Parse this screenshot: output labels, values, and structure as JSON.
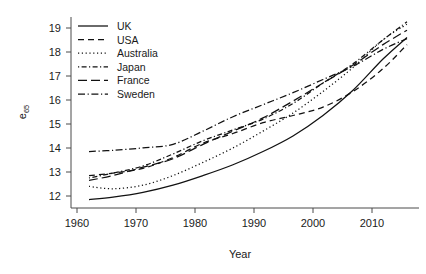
{
  "chart_data": {
    "type": "line",
    "title": "",
    "xlabel": "Year",
    "ylabel": "e65",
    "ylabel_base": "e",
    "ylabel_sub": "65",
    "xlim": [
      1958,
      2016
    ],
    "ylim": [
      11.5,
      19.45
    ],
    "xticks": [
      1960,
      1970,
      1980,
      1990,
      2000,
      2010
    ],
    "yticks": [
      12,
      13,
      14,
      15,
      16,
      17,
      18,
      19
    ],
    "xtick_labels": [
      "1960",
      "1970",
      "1980",
      "1990",
      "2000",
      "2010"
    ],
    "ytick_labels": [
      "12",
      "13",
      "14",
      "15",
      "16",
      "17",
      "18",
      "19"
    ],
    "grid": false,
    "legend_position": "top-left",
    "legend_entries": [
      "UK",
      "USA",
      "Australia",
      "Japan",
      "France",
      "Sweden"
    ],
    "x": [
      1961,
      1965,
      1970,
      1975,
      1980,
      1985,
      1990,
      1995,
      2000,
      2005,
      2010,
      2014
    ],
    "series": [
      {
        "name": "UK",
        "style": "solid",
        "dash": "none",
        "color": "#111111",
        "values": [
          11.85,
          11.95,
          12.15,
          12.45,
          12.85,
          13.3,
          13.85,
          14.5,
          15.35,
          16.4,
          17.7,
          18.6
        ]
      },
      {
        "name": "USA",
        "style": "dashed",
        "dash": "6,4",
        "color": "#111111",
        "values": [
          12.85,
          12.95,
          13.15,
          13.6,
          14.2,
          14.6,
          15.05,
          15.35,
          15.7,
          16.35,
          17.3,
          18.3
        ]
      },
      {
        "name": "Australia",
        "style": "dotted",
        "dash": "1.2,2.6",
        "color": "#111111",
        "values": [
          12.4,
          12.3,
          12.45,
          12.85,
          13.4,
          14.0,
          14.7,
          15.45,
          16.35,
          17.35,
          18.5,
          19.15
        ]
      },
      {
        "name": "Japan",
        "style": "dashdot-short",
        "dash": "1.2,2.4,5,2.4",
        "color": "#111111",
        "values": [
          12.75,
          12.95,
          13.25,
          13.75,
          14.3,
          14.75,
          15.2,
          15.85,
          16.7,
          17.5,
          18.5,
          19.25
        ]
      },
      {
        "name": "France",
        "style": "longdash",
        "dash": "9,4",
        "color": "#111111",
        "values": [
          12.65,
          12.85,
          13.2,
          13.55,
          14.15,
          14.7,
          15.25,
          15.95,
          16.7,
          17.45,
          18.3,
          18.9
        ]
      },
      {
        "name": "Sweden",
        "style": "dashdotdot",
        "dash": "7,2.6,1.2,2.6",
        "color": "#111111",
        "values": [
          13.85,
          13.9,
          14.0,
          14.15,
          14.7,
          15.3,
          15.8,
          16.3,
          16.85,
          17.4,
          18.1,
          18.55
        ]
      }
    ]
  },
  "axes": {
    "x_label": "Year",
    "y_label_base": "e",
    "y_label_sub": "65"
  }
}
